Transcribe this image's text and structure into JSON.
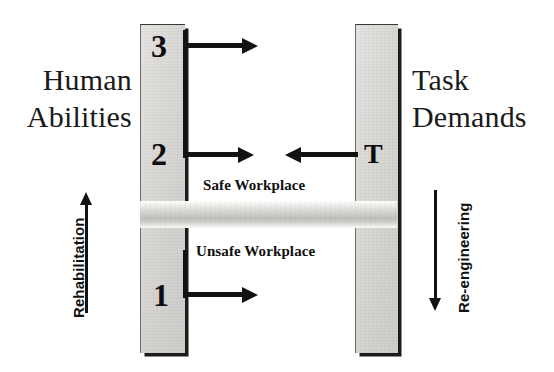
{
  "diagram": {
    "left_heading": "Human\nAbilities",
    "left_heading_line1": "Human",
    "left_heading_line2": "Abilities",
    "right_heading_line1": "Task",
    "right_heading_line2": "Demands",
    "colors": {
      "pillar_fill": "#dcdad7",
      "beam_fill": "#cbc9c5",
      "outline": "#121212",
      "text": "#101010",
      "background": "#ffffff"
    }
  },
  "pillars": {
    "left": {
      "name": "human-abilities-pillar",
      "markers": [
        {
          "label": "3",
          "meaning": "ability-level-3-above-demands"
        },
        {
          "label": "2",
          "meaning": "ability-level-2-matches-demands"
        },
        {
          "label": "1",
          "meaning": "ability-level-1-below-demands"
        }
      ]
    },
    "right": {
      "name": "task-demands-pillar",
      "markers": [
        {
          "label": "T",
          "meaning": "task-demand-level"
        }
      ]
    }
  },
  "zones": {
    "safe": "Safe Workplace",
    "unsafe": "Unsafe Workplace"
  },
  "arrows": {
    "ability_3": {
      "label": "3",
      "direction": "right"
    },
    "ability_2": {
      "label": "2",
      "direction": "right"
    },
    "task_t": {
      "label": "T",
      "direction": "left"
    },
    "ability_1": {
      "label": "1",
      "direction": "right"
    }
  },
  "processes": {
    "left": {
      "label": "Rehabilitation",
      "direction": "up"
    },
    "right": {
      "label": "Re-engineering",
      "direction": "down"
    }
  }
}
